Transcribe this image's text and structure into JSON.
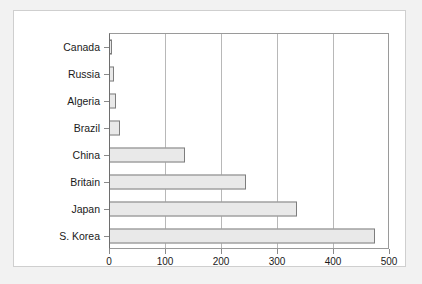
{
  "chart_data": {
    "type": "bar",
    "orientation": "horizontal",
    "title": "",
    "xlabel": "",
    "ylabel": "",
    "categories": [
      "Canada",
      "Russia",
      "Algeria",
      "Brazil",
      "China",
      "Britain",
      "Japan",
      "S. Korea"
    ],
    "values": [
      5,
      9,
      13,
      20,
      135,
      245,
      335,
      475
    ],
    "xlim": [
      0,
      500
    ],
    "xticks": [
      0,
      100,
      200,
      300,
      400,
      500
    ],
    "xtick_labels": [
      "0",
      "100",
      "200",
      "300",
      "400",
      "500"
    ],
    "grid": "vertical",
    "legend": "none",
    "bar_fill": "#e9e9e9",
    "bar_edge": "#7d7d7d",
    "plot_background": "#ffffff",
    "figure_background": "#f2f2f2",
    "gridline_color": "#b8b8b8",
    "axis_color": "#8a8a8a",
    "text_color": "#1a1a1a"
  }
}
